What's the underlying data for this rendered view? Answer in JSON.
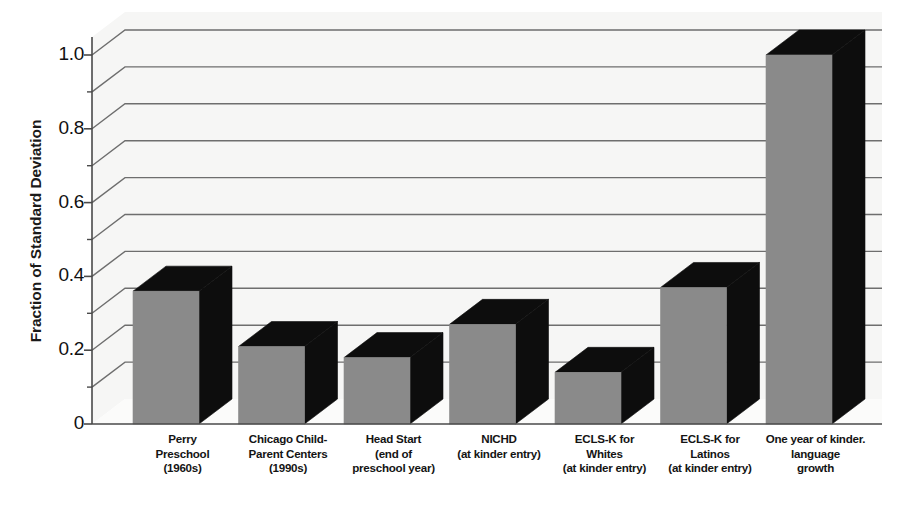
{
  "chart_data": {
    "type": "bar",
    "title": "",
    "subtitle": "",
    "xlabel": "",
    "ylabel": "Fraction of Standard Deviation",
    "ylim": [
      0,
      1.07
    ],
    "ytick_values": [
      0,
      0.2,
      0.4,
      0.6,
      0.8,
      1.0
    ],
    "ytick_labels": [
      "0",
      "0.2",
      "0.4",
      "0.6",
      "0.8",
      "1.0"
    ],
    "minor_tick_values": [
      0.1,
      0.3,
      0.5,
      0.7,
      0.9
    ],
    "gridlines": [
      0.1,
      0.2,
      0.3,
      0.4,
      0.5,
      0.6,
      0.7,
      0.8,
      0.9,
      1.0
    ],
    "grid": true,
    "legend": "none",
    "style": "3d-bars",
    "categories": [
      "Perry Preschool (1960s)",
      "Chicago Child-Parent Centers (1990s)",
      "Head Start (end of preschool year)",
      "NICHD (at kinder entry)",
      "ECLS-K for Whites (at kinder entry)",
      "ECLS-K for Latinos (at kinder entry)",
      "One year of kinder. language growth"
    ],
    "values": [
      0.36,
      0.21,
      0.18,
      0.27,
      0.14,
      0.37,
      1.0
    ],
    "annotations": []
  },
  "axis": {
    "y_title": "Fraction of Standard Deviation",
    "y_ticks": [
      {
        "label": "1.0",
        "value": 1.0
      },
      {
        "label": "0.8",
        "value": 0.8
      },
      {
        "label": "0.6",
        "value": 0.6
      },
      {
        "label": "0.4",
        "value": 0.4
      },
      {
        "label": "0.2",
        "value": 0.2
      },
      {
        "label": "0",
        "value": 0.0
      }
    ]
  },
  "x_labels": [
    {
      "lines": [
        "Perry",
        "Preschool",
        "(1960s)"
      ]
    },
    {
      "lines": [
        "Chicago Child-",
        "Parent Centers",
        "(1990s)"
      ]
    },
    {
      "lines": [
        "Head Start",
        "(end of",
        "preschool year)"
      ]
    },
    {
      "lines": [
        "NICHD",
        "(at kinder entry)",
        ""
      ]
    },
    {
      "lines": [
        "ECLS-K for",
        "Whites",
        "(at kinder entry)"
      ]
    },
    {
      "lines": [
        "ECLS-K for",
        "Latinos",
        "(at kinder entry)"
      ]
    },
    {
      "lines": [
        "One year of kinder.",
        "language",
        "growth"
      ]
    }
  ],
  "colors": {
    "bar_front": "#8a8a8a",
    "bar_top": "#0d0d0d",
    "bar_side": "#0d0d0d",
    "gridline": "#6e6e6e",
    "axis_line": "#4a4a4a",
    "panel_background": "#f6f6f5",
    "page_background": "#ffffff",
    "text": "#111111"
  }
}
